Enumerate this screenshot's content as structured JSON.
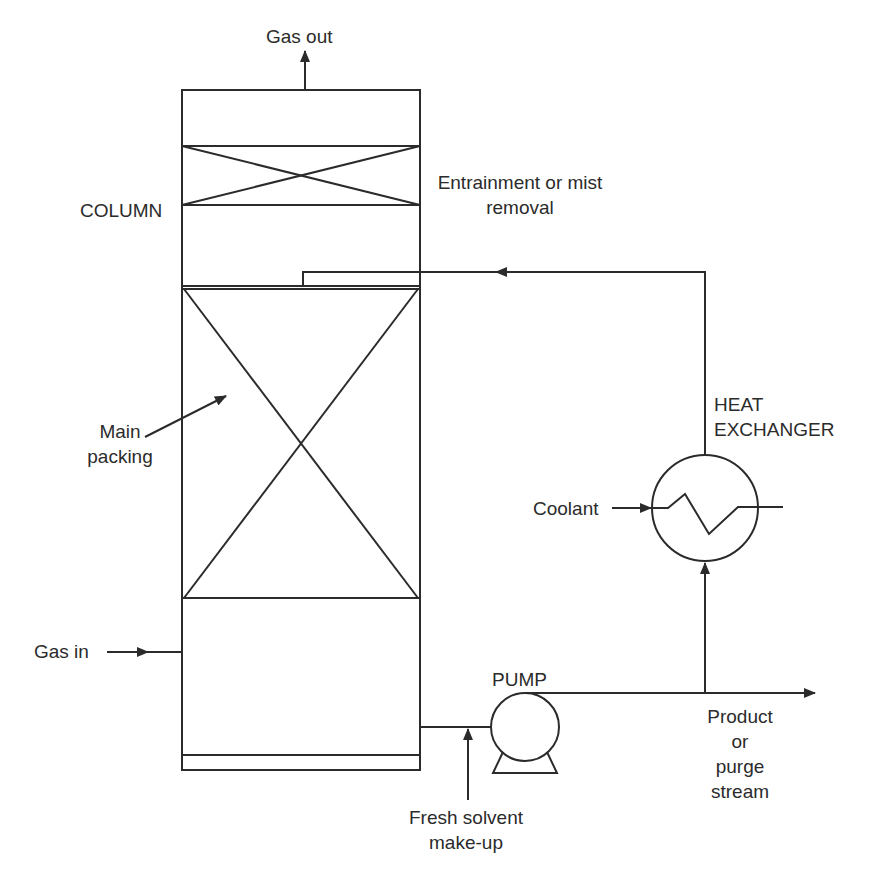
{
  "diagram": {
    "type": "process-flow",
    "labels": {
      "gas_out": "Gas out",
      "column": "COLUMN",
      "mist_line1": "Entrainment or mist",
      "mist_line2": "removal",
      "main_line1": "Main",
      "main_line2": "packing",
      "heat_line1": "HEAT",
      "heat_line2": "EXCHANGER",
      "coolant": "Coolant",
      "gas_in": "Gas in",
      "pump": "PUMP",
      "product_line1": "Product",
      "product_line2": "or",
      "product_line3": "purge",
      "product_line4": "stream",
      "fresh_line1": "Fresh solvent",
      "fresh_line2": "make-up"
    },
    "components": [
      "COLUMN",
      "Entrainment or mist removal",
      "Main packing",
      "HEAT EXCHANGER",
      "PUMP"
    ],
    "streams": [
      "Gas in",
      "Gas out",
      "Coolant",
      "Fresh solvent make-up",
      "Product or purge stream",
      "Solvent recycle"
    ],
    "colors": {
      "line": "#2b2b2b",
      "background": "#ffffff"
    }
  }
}
